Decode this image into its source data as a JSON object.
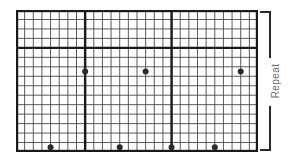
{
  "chart_data": {
    "type": "table",
    "title": "",
    "xlabel": "",
    "ylabel": "",
    "grid": {
      "columns": 28,
      "rows": 15,
      "cell_width": 8.64,
      "cell_height": 9.47,
      "x_range": [
        0,
        28
      ],
      "y_range": [
        0,
        15
      ],
      "grid_on": true,
      "thin_line_color": "#4a4a4a",
      "thick_line_color": "#1a1a1a",
      "background_color": "#ffffff",
      "border_color": "#1a1a1a"
    },
    "section_divider_rows": [
      4
    ],
    "repeat_divider_columns": [
      8,
      18
    ],
    "sections": [
      {
        "name": "upper-section",
        "start_row": 0,
        "end_row": 4,
        "row_count": 4
      },
      {
        "name": "lower-section",
        "start_row": 4,
        "end_row": 15,
        "row_count": 11
      }
    ],
    "panels": [
      {
        "name": "panel-left",
        "start_col": 0,
        "end_col": 8
      },
      {
        "name": "panel-center",
        "start_col": 8,
        "end_col": 18
      },
      {
        "name": "panel-right",
        "start_col": 18,
        "end_col": 28
      }
    ],
    "symbol": {
      "name": "dot",
      "shape": "filled-circle",
      "color": "#2b2b2b",
      "radius": 3
    },
    "series": [
      {
        "name": "dots-middle-row",
        "row": 6,
        "columns": [
          8,
          15,
          26
        ],
        "points": [
          {
            "col": 8,
            "row": 6
          },
          {
            "col": 15,
            "row": 6
          },
          {
            "col": 26,
            "row": 6
          }
        ]
      },
      {
        "name": "dots-bottom-row",
        "row": 14,
        "columns": [
          4,
          12,
          18,
          23
        ],
        "points": [
          {
            "col": 4,
            "row": 14
          },
          {
            "col": 12,
            "row": 14
          },
          {
            "col": 18,
            "row": 14
          },
          {
            "col": 23,
            "row": 14
          }
        ]
      }
    ],
    "annotations": [
      {
        "name": "repeat",
        "text": "Repeat",
        "position": "right",
        "orientation": "vertical",
        "color": "#6e6e6e"
      }
    ]
  },
  "repeat": {
    "label": "Repeat"
  }
}
